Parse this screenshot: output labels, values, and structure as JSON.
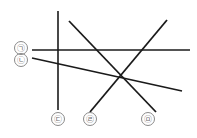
{
  "figure": {
    "canvas": {
      "width": 197,
      "height": 138
    },
    "stroke_color": "#1a1a1a",
    "label_color": "#6f6f6f",
    "label_circle_color": "#8a8a8a",
    "background_color": "#ffffff",
    "lines": [
      {
        "id": "line-ga",
        "label": "㉠",
        "label_name": "ga",
        "description": "horizontal line",
        "x1": 32,
        "y1": 50,
        "x2": 190,
        "y2": 50,
        "width": 1.6
      },
      {
        "id": "line-na",
        "label": "㉡",
        "label_name": "na",
        "description": "gently descending line to the right",
        "x1": 32,
        "y1": 58,
        "x2": 182,
        "y2": 91,
        "width": 1.6
      },
      {
        "id": "line-da",
        "label": "㉢",
        "label_name": "da",
        "description": "vertical line",
        "x1": 58,
        "y1": 11,
        "x2": 58,
        "y2": 110,
        "width": 1.6
      },
      {
        "id": "line-ra",
        "label": "㉣",
        "label_name": "ra",
        "description": "diagonal from upper-left to lower-right through center",
        "x1": 69,
        "y1": 21,
        "x2": 156,
        "y2": 112,
        "width": 1.8
      },
      {
        "id": "line-ma",
        "label": "㉤",
        "label_name": "ma",
        "description": "diagonal from lower-left to upper-right through center",
        "x1": 90,
        "y1": 112,
        "x2": 167,
        "y2": 20,
        "width": 1.8
      }
    ],
    "labels": [
      {
        "id": "label-ga",
        "text": "㉠",
        "cx": 21,
        "cy": 48,
        "r": 6.5,
        "for_line": "line-ga"
      },
      {
        "id": "label-na",
        "text": "㉡",
        "cx": 21,
        "cy": 60,
        "r": 6.5,
        "for_line": "line-na"
      },
      {
        "id": "label-da",
        "text": "㉢",
        "cx": 58,
        "cy": 119,
        "r": 6.5,
        "for_line": "line-da"
      },
      {
        "id": "label-ra",
        "text": "㉣",
        "cx": 90,
        "cy": 119,
        "r": 6.5,
        "for_line": "line-ra"
      },
      {
        "id": "label-ma",
        "text": "㉤",
        "cx": 148,
        "cy": 119,
        "r": 6.5,
        "for_line": "line-ma"
      }
    ],
    "intersection": {
      "x": 119,
      "y": 78,
      "name": "common-crossing-point"
    }
  }
}
